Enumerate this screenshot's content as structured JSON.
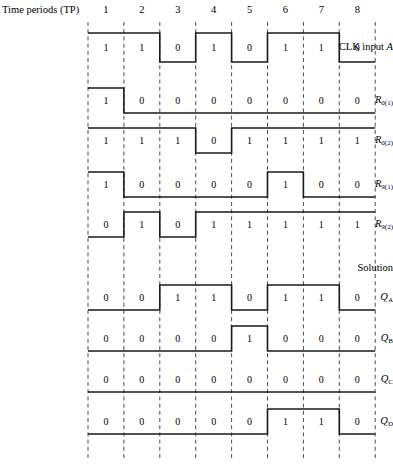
{
  "header": {
    "time_periods_label": "Time periods (TP)",
    "tp_numbers": [
      "1",
      "2",
      "3",
      "4",
      "5",
      "6",
      "7",
      "8"
    ],
    "solution_label": "Solution"
  },
  "colors": {
    "waveform": "#1a1a1a",
    "gridline": "#4d4d4d",
    "text": "#000000",
    "background": "#ffffff"
  },
  "chart_data": {
    "type": "line",
    "title": "Time periods (TP)",
    "xlabel": "Time periods (TP)",
    "ylabel": "",
    "categories": [
      "1",
      "2",
      "3",
      "4",
      "5",
      "6",
      "7",
      "8"
    ],
    "grid": true,
    "legend": "none",
    "series": [
      {
        "name": "CLK input A",
        "label_html": "CLK input <i>A</i>",
        "label_base": "CLK input",
        "label_sub": "",
        "label_italic_part": "A",
        "values": [
          1,
          1,
          0,
          1,
          0,
          1,
          1,
          0
        ]
      },
      {
        "name": "R0(1)",
        "label_base": "R",
        "label_sub": "0(1)",
        "values": [
          1,
          0,
          0,
          0,
          0,
          0,
          0,
          0
        ]
      },
      {
        "name": "R0(2)",
        "label_base": "R",
        "label_sub": "0(2)",
        "values": [
          1,
          1,
          1,
          0,
          1,
          1,
          1,
          1
        ]
      },
      {
        "name": "R9(1)",
        "label_base": "R",
        "label_sub": "9(1)",
        "values": [
          1,
          0,
          0,
          0,
          0,
          1,
          0,
          0
        ]
      },
      {
        "name": "R9(2)",
        "label_base": "R",
        "label_sub": "9(2)",
        "values": [
          0,
          1,
          0,
          1,
          1,
          1,
          1,
          1
        ]
      },
      {
        "name": "QA",
        "label_base": "Q",
        "label_sub": "A",
        "values": [
          0,
          0,
          1,
          1,
          0,
          1,
          1,
          0
        ]
      },
      {
        "name": "QB",
        "label_base": "Q",
        "label_sub": "B",
        "values": [
          0,
          0,
          0,
          0,
          1,
          0,
          0,
          0
        ]
      },
      {
        "name": "QC",
        "label_base": "Q",
        "label_sub": "C",
        "values": [
          0,
          0,
          0,
          0,
          0,
          0,
          0,
          0
        ]
      },
      {
        "name": "QD",
        "label_base": "Q",
        "label_sub": "D",
        "values": [
          0,
          0,
          0,
          0,
          0,
          1,
          1,
          0
        ]
      }
    ]
  },
  "geometry": {
    "grid_x_start": 88,
    "grid_x_step": 35.9,
    "grid_y_top": 22,
    "grid_y_bottom": 458,
    "row_tops": [
      33,
      88,
      128,
      172,
      212,
      285,
      326,
      367,
      409
    ],
    "row_high_y": [
      33,
      88,
      128,
      172,
      212,
      285,
      326,
      367,
      409
    ],
    "row_low_y": [
      62,
      113,
      153,
      197,
      237,
      310,
      351,
      392,
      434
    ]
  }
}
